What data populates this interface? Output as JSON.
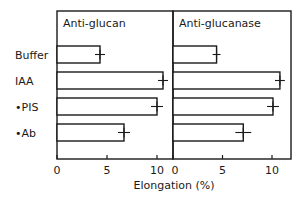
{
  "chart_data": {
    "type": "bar",
    "orientation": "horizontal",
    "xlabel": "Elongation (%)",
    "ylabel": "",
    "categories": [
      "Buffer",
      "IAA",
      "+PIS",
      "+Ab"
    ],
    "panels": [
      {
        "title": "Anti-glucan",
        "xlim": [
          0,
          11.5
        ],
        "xticks": [
          0,
          5,
          10
        ],
        "values": [
          4.3,
          10.6,
          10.0,
          6.7
        ],
        "errors": [
          0.5,
          0.5,
          0.6,
          0.6
        ]
      },
      {
        "title": "Anti-glucanase",
        "xlim": [
          0,
          11.8
        ],
        "xticks": [
          0,
          5,
          10
        ],
        "values": [
          4.4,
          10.8,
          10.1,
          7.1
        ],
        "errors": [
          0.4,
          0.5,
          0.6,
          0.8
        ]
      }
    ],
    "grid": false,
    "legend": null
  },
  "labels": {
    "categories": [
      "Buffer",
      "IAA",
      "+PIS",
      "+Ab"
    ],
    "panel_titles": [
      "Anti-glucan",
      "Anti-glucanase"
    ],
    "xlabel": "Elongation (%)",
    "tick_labels": [
      "0",
      "5",
      "10"
    ]
  }
}
